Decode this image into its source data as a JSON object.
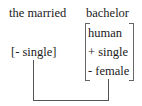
{
  "diagram": {
    "phrase_label": "the married",
    "word_label": "bachelor",
    "modifier_feature": "[- single]",
    "feature_matrix": [
      "human",
      "+ single",
      "- female"
    ],
    "connector": {
      "from": "[- single]",
      "to": "- female",
      "color": "#555555"
    }
  }
}
